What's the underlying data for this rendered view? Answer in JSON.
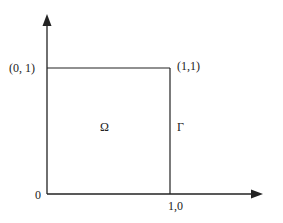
{
  "diagram": {
    "type": "unit-square-domain",
    "labels": {
      "top_left": "(0, 1)",
      "top_right": "(1,1)",
      "interior": "Ω",
      "boundary": "Γ",
      "origin": "0",
      "bottom_right": "1,0"
    },
    "colors": {
      "stroke": "#222222",
      "background": "#ffffff"
    },
    "axes": {
      "x_axis": "arrow pointing right",
      "y_axis": "arrow pointing up"
    },
    "square": {
      "corners": [
        "(0,0)",
        "(0,1)",
        "(1,1)",
        "(1,0)"
      ]
    }
  }
}
